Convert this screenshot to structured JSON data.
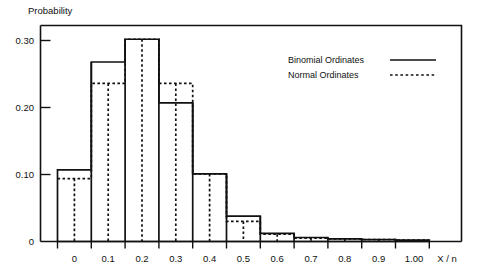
{
  "chart_data": {
    "type": "bar",
    "title": "",
    "ylabel": "Probability",
    "xlabel": "X / n",
    "ylim": [
      0,
      0.3225
    ],
    "xlim": [
      -0.05,
      1.05
    ],
    "grid": false,
    "categories": [
      "0",
      "0.1",
      "0.2",
      "0.3",
      "0.4",
      "0.5",
      "0.6",
      "0.7",
      "0.8",
      "0.9",
      "1.00"
    ],
    "x": [
      0,
      0.1,
      0.2,
      0.3,
      0.4,
      0.5,
      0.6,
      0.7,
      0.8,
      0.9,
      1.0
    ],
    "series": [
      {
        "name": "Binomial Ordinates",
        "style": "solid-step-histogram",
        "values": [
          0.107,
          0.268,
          0.302,
          0.207,
          0.101,
          0.038,
          0.012,
          0.006,
          0.004,
          0.003,
          0.002
        ]
      },
      {
        "name": "Normal Ordinates",
        "style": "dotted-step",
        "values": [
          0.094,
          0.236,
          0.302,
          0.236,
          0.101,
          0.03,
          0.011,
          0.005,
          0.004,
          0.003,
          0.002
        ]
      }
    ],
    "ytick_values": [
      0,
      0.1,
      0.2,
      0.3
    ],
    "ytick_labels": [
      "0",
      "0.10",
      "0.20",
      "0.30"
    ],
    "legend_position": "upper-right-inside",
    "legend_entries": [
      {
        "label": "Binomial Ordinates",
        "marker": "solid-line"
      },
      {
        "label": "Normal Ordinates",
        "marker": "dotted-line"
      }
    ]
  },
  "axes": {
    "y_title": "Probability",
    "x_title": "X / n",
    "y_ticks": [
      {
        "label": "0.30"
      },
      {
        "label": "0.20"
      },
      {
        "label": "0.10"
      },
      {
        "label": "0"
      }
    ],
    "x_ticks": [
      {
        "label": "0"
      },
      {
        "label": "0.1"
      },
      {
        "label": "0.2"
      },
      {
        "label": "0.3"
      },
      {
        "label": "0.4"
      },
      {
        "label": "0.5"
      },
      {
        "label": "0.6"
      },
      {
        "label": "0.7"
      },
      {
        "label": "0.8"
      },
      {
        "label": "0.9"
      },
      {
        "label": "1.00"
      }
    ]
  },
  "legend": {
    "binomial_label": "Binomial Ordinates",
    "normal_label": "Normal Ordinates"
  },
  "colors": {
    "ink": "#111111",
    "background": "#ffffff"
  }
}
